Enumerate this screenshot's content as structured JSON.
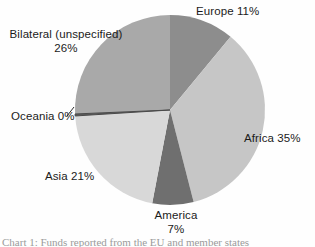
{
  "chart_data": {
    "type": "pie",
    "title": "",
    "subtitle": "",
    "xlabel": "",
    "ylabel": "",
    "legend_position": "none",
    "grid": false,
    "labels_inline": true,
    "unit": "%",
    "categories": [
      "Europe",
      "Africa",
      "America",
      "Asia",
      "Oceania",
      "Bilateral (unspecified)"
    ],
    "values": [
      11,
      35,
      7,
      21,
      0,
      26
    ],
    "start_angle_deg": 0,
    "direction": "clockwise",
    "slices": [
      {
        "name": "Europe",
        "value": 11,
        "label": "Europe 11%",
        "label_lines": [
          "Europe 11%"
        ],
        "color": "#8d8d8d",
        "start_deg": 0.0,
        "end_deg": 39.6
      },
      {
        "name": "Africa",
        "value": 35,
        "label": "Africa 35%",
        "label_lines": [
          "Africa 35%"
        ],
        "color": "#c6c6c6",
        "start_deg": 39.6,
        "end_deg": 165.6
      },
      {
        "name": "America",
        "value": 7,
        "label": "America 7%",
        "label_lines": [
          "America",
          "7%"
        ],
        "color": "#6f6f6f",
        "start_deg": 165.6,
        "end_deg": 190.8
      },
      {
        "name": "Asia",
        "value": 21,
        "label": "Asia 21%",
        "label_lines": [
          "Asia 21%"
        ],
        "color": "#d8d8d8",
        "start_deg": 190.8,
        "end_deg": 266.4
      },
      {
        "name": "Oceania",
        "value": 0,
        "label": "Oceania 0%",
        "label_lines": [
          "Oceania 0%"
        ],
        "color": "#5a5a5a",
        "start_deg": 266.4,
        "end_deg": 267.6
      },
      {
        "name": "Bilateral (unspecified)",
        "value": 26,
        "label": "Bilateral (unspecified) 26%",
        "label_lines": [
          "Bilateral (unspecified)",
          "26%"
        ],
        "color": "#a9a9a9",
        "start_deg": 267.6,
        "end_deg": 360.0
      }
    ],
    "geometry": {
      "center_x": 170,
      "center_y": 110,
      "radius": 95
    }
  },
  "labels": {
    "europe": "Europe 11%",
    "africa": "Africa 35%",
    "asia": "Asia 21%",
    "oceania": "Oceania 0%",
    "america_name": "America",
    "america_pct": "7%",
    "bilateral_name": "Bilateral (unspecified)",
    "bilateral_pct": "26%"
  },
  "caption": {
    "text": "Chart 1: Funds reported from the EU and member states"
  },
  "colors": {
    "europe": "#8d8d8d",
    "africa": "#c6c6c6",
    "america": "#6f6f6f",
    "asia": "#d8d8d8",
    "oceania": "#5a5a5a",
    "bilateral": "#a9a9a9",
    "background": "#fefefe",
    "text": "#1b1b1b"
  }
}
